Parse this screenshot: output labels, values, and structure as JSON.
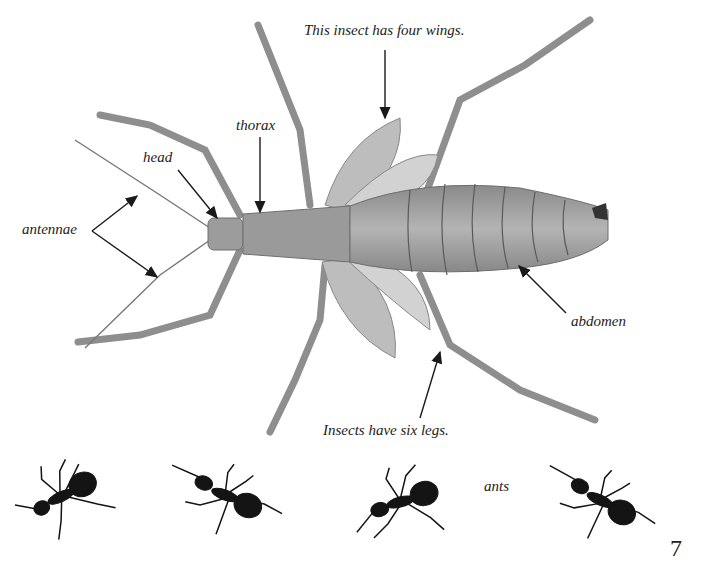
{
  "page": {
    "page_number": "7",
    "background": "#ffffff"
  },
  "diagram": {
    "labels": {
      "wings_caption": "This insect has four wings.",
      "thorax": "thorax",
      "head": "head",
      "antennae": "antennae",
      "abdomen": "abdomen",
      "legs_caption": "Insects have six legs."
    },
    "colors": {
      "body": "#a8a8a8",
      "body_dark": "#6e6e6e",
      "wing": "#c4c4c4",
      "arrow": "#1a1a1a",
      "text": "#222222"
    }
  },
  "ants_row": {
    "label": "ants",
    "count": 4,
    "color": "#141414"
  }
}
